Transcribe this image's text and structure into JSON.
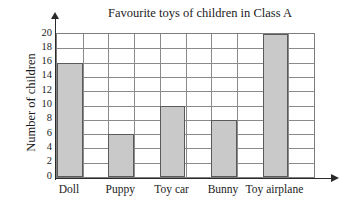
{
  "chart_data": {
    "type": "bar",
    "title": "Favourite toys of children in Class A",
    "xlabel": "",
    "ylabel": "Number of children",
    "categories": [
      "Doll",
      "Puppy",
      "Toy car",
      "Bunny",
      "Toy airplane"
    ],
    "values": [
      16,
      6,
      10,
      8,
      20
    ],
    "ylim": [
      0,
      20
    ],
    "ytick_step": 2,
    "yticks": [
      0,
      2,
      4,
      6,
      8,
      10,
      12,
      14,
      16,
      18,
      20
    ],
    "ytick_labels": [
      "0",
      "2",
      "4",
      "6",
      "8",
      "10",
      "12",
      "14",
      "16",
      "18",
      "20"
    ],
    "grid": "both",
    "legend": "none",
    "bar_fill_color": "#c9c9c9",
    "bar_edge_color": "#5a5a5a",
    "axis_color": "#2a2a2a",
    "grid_color": "#8a8a8a",
    "background_color": "#ffffff"
  }
}
